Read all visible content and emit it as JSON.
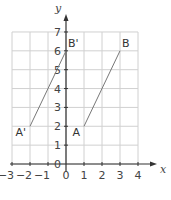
{
  "chart_data": {
    "type": "line",
    "title": "",
    "xlabel": "x",
    "ylabel": "y",
    "xlim": [
      -3,
      4
    ],
    "ylim": [
      0,
      7
    ],
    "grid": true,
    "x_ticks": [
      "-3",
      "-2",
      "-1",
      "0",
      "1",
      "2",
      "3",
      "4"
    ],
    "y_ticks": [
      "0",
      "1",
      "2",
      "3",
      "4",
      "5",
      "6",
      "7"
    ],
    "series": [
      {
        "name": "AB",
        "points": [
          {
            "label": "A",
            "x": 1,
            "y": 2
          },
          {
            "label": "B",
            "x": 3,
            "y": 6
          }
        ]
      },
      {
        "name": "A'B'",
        "points": [
          {
            "label": "A'",
            "x": -2,
            "y": 2
          },
          {
            "label": "B'",
            "x": 0,
            "y": 6
          }
        ]
      }
    ]
  },
  "colors": {
    "grid": "#d0d0d0",
    "axis": "#333333",
    "segment": "#777777",
    "text": "#444444"
  }
}
